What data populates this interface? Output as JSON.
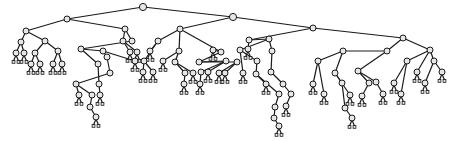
{
  "diagram": {
    "type": "tree",
    "colors": {
      "edge": "#1a1a1a",
      "node_fill": "#e6e6e6",
      "background": "#ffffff"
    },
    "nodes": [
      [
        143,
        7
      ],
      [
        67,
        19
      ],
      [
        233,
        17
      ],
      [
        26,
        31
      ],
      [
        125,
        29
      ],
      [
        180,
        29
      ],
      [
        313,
        28
      ],
      [
        21,
        42
      ],
      [
        45,
        41
      ],
      [
        123,
        41
      ],
      [
        132,
        41
      ],
      [
        81,
        49
      ],
      [
        103,
        51
      ],
      [
        158,
        41
      ],
      [
        179,
        51
      ],
      [
        221,
        52
      ],
      [
        249,
        40
      ],
      [
        269,
        39
      ],
      [
        403,
        38
      ],
      [
        16,
        53
      ],
      [
        24,
        53
      ],
      [
        35,
        53
      ],
      [
        58,
        51
      ],
      [
        130,
        52
      ],
      [
        137,
        52
      ],
      [
        107,
        57
      ],
      [
        135,
        61
      ],
      [
        150,
        51
      ],
      [
        144,
        61
      ],
      [
        163,
        61
      ],
      [
        175,
        62
      ],
      [
        199,
        62
      ],
      [
        213,
        50
      ],
      [
        226,
        61
      ],
      [
        237,
        62
      ],
      [
        240,
        50
      ],
      [
        248,
        49
      ],
      [
        257,
        61
      ],
      [
        272,
        51
      ],
      [
        343,
        51
      ],
      [
        387,
        51
      ],
      [
        430,
        50
      ],
      [
        31,
        64
      ],
      [
        40,
        64
      ],
      [
        53,
        64
      ],
      [
        62,
        64
      ],
      [
        98,
        64
      ],
      [
        110,
        73
      ],
      [
        143,
        72
      ],
      [
        153,
        72
      ],
      [
        185,
        73
      ],
      [
        193,
        73
      ],
      [
        201,
        72
      ],
      [
        208,
        72
      ],
      [
        219,
        73
      ],
      [
        225,
        73
      ],
      [
        243,
        73
      ],
      [
        256,
        74
      ],
      [
        271,
        72
      ],
      [
        283,
        84
      ],
      [
        318,
        61
      ],
      [
        335,
        73
      ],
      [
        358,
        71
      ],
      [
        369,
        83
      ],
      [
        407,
        61
      ],
      [
        417,
        72
      ],
      [
        434,
        61
      ],
      [
        442,
        72
      ],
      [
        76,
        84
      ],
      [
        99,
        84
      ],
      [
        184,
        84
      ],
      [
        200,
        84
      ],
      [
        266,
        84
      ],
      [
        279,
        94
      ],
      [
        291,
        94
      ],
      [
        313,
        84
      ],
      [
        324,
        94
      ],
      [
        342,
        83
      ],
      [
        350,
        95
      ],
      [
        362,
        96
      ],
      [
        376,
        82
      ],
      [
        383,
        94
      ],
      [
        394,
        83
      ],
      [
        401,
        94
      ],
      [
        425,
        83
      ],
      [
        79,
        95
      ],
      [
        92,
        95
      ],
      [
        100,
        95
      ],
      [
        275,
        107
      ],
      [
        286,
        106
      ],
      [
        345,
        108
      ],
      [
        352,
        118
      ],
      [
        90,
        107
      ],
      [
        96,
        117
      ],
      [
        274,
        118
      ],
      [
        279,
        126
      ]
    ],
    "edges": [
      [
        0,
        1
      ],
      [
        0,
        2
      ],
      [
        1,
        3
      ],
      [
        1,
        4
      ],
      [
        2,
        5
      ],
      [
        2,
        6
      ],
      [
        3,
        7
      ],
      [
        3,
        8
      ],
      [
        4,
        9
      ],
      [
        4,
        10
      ],
      [
        10,
        11
      ],
      [
        11,
        12
      ],
      [
        5,
        13
      ],
      [
        5,
        14
      ],
      [
        5,
        15
      ],
      [
        6,
        16
      ],
      [
        6,
        18
      ],
      [
        16,
        17
      ],
      [
        7,
        19
      ],
      [
        7,
        20
      ],
      [
        8,
        21
      ],
      [
        8,
        22
      ],
      [
        9,
        23
      ],
      [
        9,
        24
      ],
      [
        12,
        25
      ],
      [
        12,
        26
      ],
      [
        13,
        27
      ],
      [
        13,
        28
      ],
      [
        14,
        29
      ],
      [
        14,
        30
      ],
      [
        15,
        32
      ],
      [
        15,
        31
      ],
      [
        31,
        33
      ],
      [
        31,
        34
      ],
      [
        17,
        35
      ],
      [
        16,
        36
      ],
      [
        35,
        37
      ],
      [
        17,
        38
      ],
      [
        18,
        40
      ],
      [
        18,
        41
      ],
      [
        40,
        39
      ],
      [
        21,
        42
      ],
      [
        21,
        43
      ],
      [
        22,
        44
      ],
      [
        22,
        45
      ],
      [
        11,
        46
      ],
      [
        25,
        47
      ],
      [
        28,
        48
      ],
      [
        28,
        49
      ],
      [
        30,
        50
      ],
      [
        30,
        51
      ],
      [
        33,
        52
      ],
      [
        33,
        53
      ],
      [
        34,
        54
      ],
      [
        34,
        55
      ],
      [
        35,
        56
      ],
      [
        37,
        57
      ],
      [
        38,
        58
      ],
      [
        58,
        59
      ],
      [
        39,
        60
      ],
      [
        39,
        61
      ],
      [
        40,
        62
      ],
      [
        62,
        63
      ],
      [
        41,
        64
      ],
      [
        41,
        65
      ],
      [
        41,
        66
      ],
      [
        66,
        67
      ],
      [
        47,
        68
      ],
      [
        46,
        69
      ],
      [
        50,
        70
      ],
      [
        52,
        71
      ],
      [
        57,
        72
      ],
      [
        57,
        73
      ],
      [
        59,
        74
      ],
      [
        60,
        75
      ],
      [
        60,
        76
      ],
      [
        61,
        77
      ],
      [
        61,
        78
      ],
      [
        63,
        79
      ],
      [
        62,
        80
      ],
      [
        80,
        81
      ],
      [
        64,
        82
      ],
      [
        64,
        83
      ],
      [
        66,
        84
      ],
      [
        68,
        85
      ],
      [
        68,
        86
      ],
      [
        69,
        87
      ],
      [
        73,
        88
      ],
      [
        74,
        89
      ],
      [
        77,
        90
      ],
      [
        90,
        91
      ],
      [
        86,
        92
      ],
      [
        92,
        93
      ],
      [
        88,
        94
      ],
      [
        94,
        95
      ]
    ]
  }
}
